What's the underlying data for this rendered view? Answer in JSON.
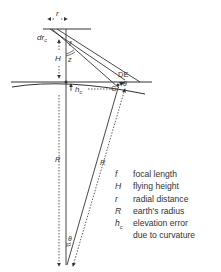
{
  "diagram": {
    "labels": {
      "r": "r",
      "dr": "dr",
      "dr_sub": "c",
      "f": "f",
      "H": "H",
      "angle_top": "z",
      "hc": "h",
      "hc_sub": "c",
      "DE": "DE",
      "C": "C",
      "theta_right": "θ",
      "R_left": "R",
      "R_right": "R",
      "theta_bottom": "θ"
    },
    "colors": {
      "line": "#333333",
      "background": "#ffffff"
    }
  },
  "legend": {
    "items": [
      {
        "symbol": "f",
        "sub": "",
        "text": "focal length"
      },
      {
        "symbol": "H",
        "sub": "",
        "text": "flying height"
      },
      {
        "symbol": "r",
        "sub": "",
        "text": "radial distance"
      },
      {
        "symbol": "R",
        "sub": "",
        "text": "earth's radius"
      },
      {
        "symbol": "h",
        "sub": "c",
        "text": "elevation error"
      },
      {
        "symbol": "",
        "sub": "",
        "text": "due to curvature"
      }
    ]
  }
}
